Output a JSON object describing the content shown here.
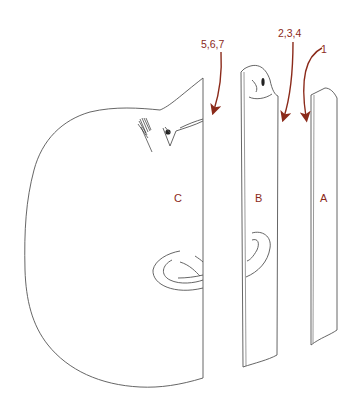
{
  "diagram": {
    "type": "exploded-section-view",
    "sections": [
      {
        "id": "C",
        "label": "C",
        "description": "main head section with face, eye, eyebrow and ear"
      },
      {
        "id": "B",
        "label": "B",
        "description": "middle slice showing nose tip and ear fragment"
      },
      {
        "id": "A",
        "label": "A",
        "description": "outermost thin slice"
      }
    ],
    "arrows": [
      {
        "label": "5,6,7",
        "target": "C"
      },
      {
        "label": "2,3,4",
        "target": "B"
      },
      {
        "label": "1",
        "target": "A"
      }
    ],
    "colors": {
      "line": "#555555",
      "accent": "#8b2a1a",
      "background": "#ffffff"
    }
  }
}
